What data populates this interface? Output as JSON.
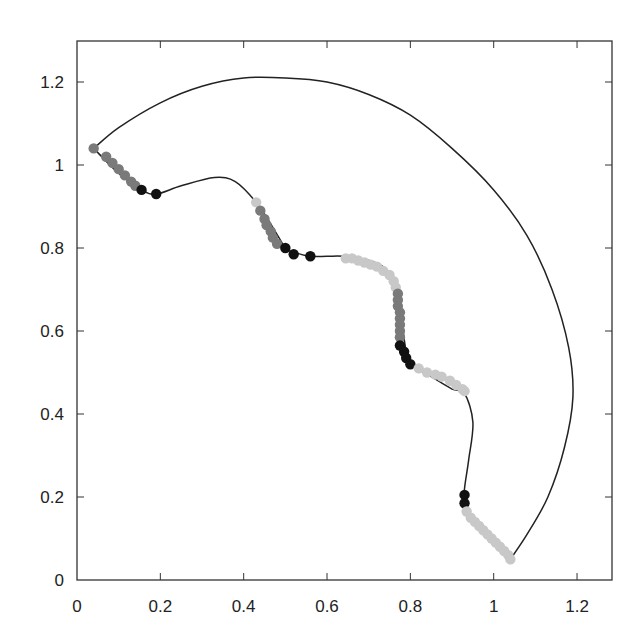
{
  "chart_data": {
    "type": "line",
    "title": "",
    "xlabel": "",
    "ylabel": "",
    "xlim": [
      0,
      1.3
    ],
    "ylim": [
      0,
      1.3
    ],
    "grid": false,
    "legend": null,
    "x_ticks": [
      0,
      0.2,
      0.4,
      0.6,
      0.8,
      1,
      1.2
    ],
    "x_tick_labels": [
      "0",
      "0.2",
      "0.4",
      "0.6",
      "0.8",
      "1",
      "1.2"
    ],
    "y_ticks": [
      0,
      0.2,
      0.4,
      0.6,
      0.8,
      1,
      1.2
    ],
    "y_tick_labels": [
      "0",
      "0.2",
      "0.4",
      "0.6",
      "0.8",
      "1",
      "1.2"
    ],
    "series": [
      {
        "name": "outer-arc",
        "style": "line",
        "color": "#222222",
        "points": [
          [
            0.04,
            1.04
          ],
          [
            0.1,
            1.09
          ],
          [
            0.2,
            1.15
          ],
          [
            0.3,
            1.19
          ],
          [
            0.4,
            1.21
          ],
          [
            0.5,
            1.21
          ],
          [
            0.6,
            1.2
          ],
          [
            0.7,
            1.17
          ],
          [
            0.8,
            1.12
          ],
          [
            0.9,
            1.04
          ],
          [
            1.0,
            0.94
          ],
          [
            1.08,
            0.83
          ],
          [
            1.14,
            0.7
          ],
          [
            1.18,
            0.56
          ],
          [
            1.19,
            0.44
          ],
          [
            1.17,
            0.32
          ],
          [
            1.13,
            0.2
          ],
          [
            1.08,
            0.11
          ],
          [
            1.04,
            0.05
          ]
        ]
      },
      {
        "name": "inner-path",
        "style": "line",
        "color": "#222222",
        "points": [
          [
            0.04,
            1.04
          ],
          [
            0.1,
            0.98
          ],
          [
            0.155,
            0.94
          ],
          [
            0.19,
            0.93
          ],
          [
            0.25,
            0.95
          ],
          [
            0.33,
            0.97
          ],
          [
            0.38,
            0.96
          ],
          [
            0.43,
            0.91
          ],
          [
            0.47,
            0.85
          ],
          [
            0.5,
            0.8
          ],
          [
            0.52,
            0.79
          ],
          [
            0.56,
            0.78
          ],
          [
            0.6,
            0.78
          ],
          [
            0.64,
            0.78
          ],
          [
            0.7,
            0.77
          ],
          [
            0.74,
            0.75
          ],
          [
            0.77,
            0.7
          ],
          [
            0.78,
            0.62
          ],
          [
            0.79,
            0.55
          ],
          [
            0.8,
            0.52
          ],
          [
            0.85,
            0.49
          ],
          [
            0.9,
            0.46
          ],
          [
            0.93,
            0.45
          ],
          [
            0.95,
            0.38
          ],
          [
            0.94,
            0.29
          ],
          [
            0.93,
            0.22
          ],
          [
            0.93,
            0.18
          ],
          [
            0.96,
            0.14
          ],
          [
            1.0,
            0.1
          ],
          [
            1.04,
            0.05
          ]
        ]
      },
      {
        "name": "markers",
        "style": "scatter",
        "groups": [
          {
            "shade": "gray",
            "color": "#7a7a7a",
            "points": [
              [
                0.04,
                1.04
              ],
              [
                0.07,
                1.02
              ],
              [
                0.085,
                1.005
              ],
              [
                0.1,
                0.99
              ],
              [
                0.115,
                0.975
              ],
              [
                0.13,
                0.96
              ],
              [
                0.14,
                0.95
              ]
            ]
          },
          {
            "shade": "black",
            "color": "#111111",
            "points": [
              [
                0.155,
                0.94
              ],
              [
                0.19,
                0.93
              ]
            ]
          },
          {
            "shade": "light",
            "color": "#c8c8c8",
            "points": [
              [
                0.43,
                0.91
              ]
            ]
          },
          {
            "shade": "gray",
            "color": "#7a7a7a",
            "points": [
              [
                0.44,
                0.89
              ],
              [
                0.45,
                0.87
              ],
              [
                0.455,
                0.855
              ],
              [
                0.465,
                0.84
              ],
              [
                0.47,
                0.825
              ],
              [
                0.48,
                0.81
              ]
            ]
          },
          {
            "shade": "black",
            "color": "#111111",
            "points": [
              [
                0.5,
                0.8
              ],
              [
                0.52,
                0.785
              ],
              [
                0.56,
                0.78
              ]
            ]
          },
          {
            "shade": "light",
            "color": "#c8c8c8",
            "points": [
              [
                0.645,
                0.775
              ],
              [
                0.66,
                0.775
              ],
              [
                0.675,
                0.77
              ],
              [
                0.69,
                0.765
              ],
              [
                0.705,
                0.76
              ],
              [
                0.72,
                0.755
              ],
              [
                0.735,
                0.745
              ],
              [
                0.75,
                0.735
              ],
              [
                0.76,
                0.72
              ],
              [
                0.765,
                0.705
              ]
            ]
          },
          {
            "shade": "gray",
            "color": "#7a7a7a",
            "points": [
              [
                0.77,
                0.69
              ],
              [
                0.77,
                0.675
              ],
              [
                0.77,
                0.66
              ],
              [
                0.775,
                0.645
              ],
              [
                0.775,
                0.63
              ],
              [
                0.775,
                0.615
              ],
              [
                0.775,
                0.6
              ],
              [
                0.775,
                0.585
              ]
            ]
          },
          {
            "shade": "black",
            "color": "#111111",
            "points": [
              [
                0.775,
                0.565
              ],
              [
                0.785,
                0.55
              ],
              [
                0.79,
                0.535
              ],
              [
                0.8,
                0.52
              ]
            ]
          },
          {
            "shade": "light",
            "color": "#c8c8c8",
            "points": [
              [
                0.82,
                0.51
              ],
              [
                0.84,
                0.5
              ],
              [
                0.86,
                0.495
              ],
              [
                0.875,
                0.49
              ],
              [
                0.895,
                0.48
              ],
              [
                0.91,
                0.47
              ],
              [
                0.925,
                0.46
              ],
              [
                0.93,
                0.455
              ]
            ]
          },
          {
            "shade": "black",
            "color": "#111111",
            "points": [
              [
                0.93,
                0.205
              ],
              [
                0.93,
                0.185
              ]
            ]
          },
          {
            "shade": "light",
            "color": "#c8c8c8",
            "points": [
              [
                0.935,
                0.165
              ],
              [
                0.945,
                0.15
              ],
              [
                0.955,
                0.14
              ],
              [
                0.965,
                0.13
              ],
              [
                0.975,
                0.12
              ],
              [
                0.985,
                0.11
              ],
              [
                0.995,
                0.1
              ],
              [
                1.005,
                0.09
              ],
              [
                1.015,
                0.08
              ],
              [
                1.025,
                0.07
              ],
              [
                1.035,
                0.06
              ],
              [
                1.04,
                0.05
              ]
            ]
          }
        ]
      }
    ]
  },
  "axes": {
    "x_tick_labels": [
      "0",
      "0.2",
      "0.4",
      "0.6",
      "0.8",
      "1",
      "1.2"
    ],
    "y_tick_labels": [
      "0",
      "0.2",
      "0.4",
      "0.6",
      "0.8",
      "1",
      "1.2"
    ]
  },
  "colors": {
    "line": "#222222",
    "frame": "#333333",
    "marker_black": "#111111",
    "marker_gray": "#7a7a7a",
    "marker_light": "#c8c8c8"
  }
}
